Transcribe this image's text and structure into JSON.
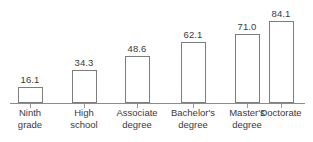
{
  "chart_data": {
    "type": "bar",
    "title": "",
    "subtitle": "",
    "xlabel": "",
    "ylabel": "",
    "ylim": [
      0,
      84.1
    ],
    "grid": false,
    "legend": false,
    "legend_position": "none",
    "axis": {
      "baseline_visible": true,
      "ticks_visible": true,
      "y_axis_visible": false
    },
    "categories": [
      "Ninth grade",
      "High school",
      "Associate degree",
      "Bachelor's degree",
      "Master's degree",
      "Doctorate"
    ],
    "category_lines": [
      [
        "Ninth",
        "grade"
      ],
      [
        "High",
        "school"
      ],
      [
        "Associate",
        "degree"
      ],
      [
        "Bachelor's",
        "degree"
      ],
      [
        "Master's",
        "degree"
      ],
      [
        "Doctorate"
      ]
    ],
    "values": [
      16.1,
      34.3,
      48.6,
      62.1,
      71.0,
      84.1
    ],
    "value_labels": [
      "16.1",
      "34.3",
      "48.6",
      "62.1",
      "71.0",
      "84.1"
    ],
    "colors": {
      "bar_fill": "#ffffff",
      "bar_stroke": "#7d7d7d",
      "axis": "#8c8c8c",
      "text": "#3a3a3a",
      "background": "#ffffff"
    }
  }
}
